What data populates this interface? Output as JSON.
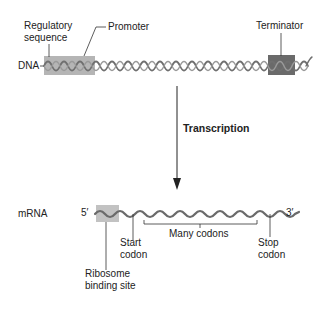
{
  "dna": {
    "label": "DNA",
    "regulatory_label_line1": "Regulatory",
    "regulatory_label_line2": "sequence",
    "promoter_label": "Promoter",
    "terminator_label": "Terminator"
  },
  "process": {
    "label": "Transcription"
  },
  "mrna": {
    "label": "mRNA",
    "five_prime": "5′",
    "three_prime": "3′",
    "start_codon_line1": "Start",
    "start_codon_line2": "codon",
    "many_codons": "Many codons",
    "stop_codon_line1": "Stop",
    "stop_codon_line2": "codon",
    "rbs_line1": "Ribosome",
    "rbs_line2": "binding site"
  },
  "colors": {
    "region_light": "#b8b8b8",
    "region_dark": "#6e6e6e",
    "helix": "#7a7a7a",
    "line": "#333333"
  }
}
